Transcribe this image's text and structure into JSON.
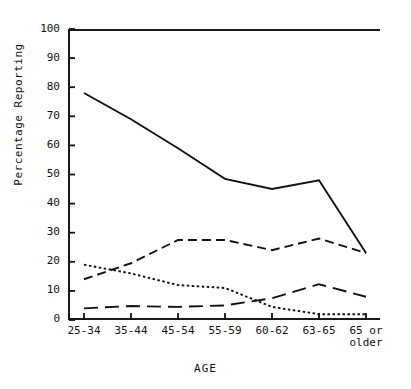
{
  "figure": {
    "background": "#ffffff",
    "ink": "#111111"
  },
  "chart_data": {
    "type": "line",
    "title": "",
    "subtitle": "",
    "xlabel": "AGE",
    "ylabel": "Percentage Reporting",
    "categories": [
      "25-34",
      "35-44",
      "45-54",
      "55-59",
      "60-62",
      "63-65",
      "65 or\nolder"
    ],
    "ylim": [
      0,
      100
    ],
    "ytick_step": 10,
    "yticks": [
      0,
      10,
      20,
      30,
      40,
      50,
      60,
      70,
      80,
      90,
      100
    ],
    "ytick_labels": [
      "0",
      "10",
      "20",
      "30",
      "40",
      "50",
      "60",
      "70",
      "80",
      "90",
      "100"
    ],
    "grid": false,
    "legend": "none",
    "frame": "left-top-bottom",
    "series": [
      {
        "name": "solid-series",
        "style": "solid",
        "dasharray": "",
        "width": 1.9,
        "color": "#111111",
        "values": [
          78,
          69,
          59,
          48.5,
          45,
          48,
          23
        ]
      },
      {
        "name": "medium-dash-series",
        "style": "dashed",
        "dasharray": "9,5",
        "width": 1.9,
        "color": "#111111",
        "values": [
          14,
          19.5,
          27.5,
          27.5,
          24,
          28,
          23
        ]
      },
      {
        "name": "dotted-series",
        "style": "dotted",
        "dasharray": "2.5,2.5",
        "width": 1.9,
        "color": "#111111",
        "values": [
          19,
          16,
          12,
          11,
          4.5,
          2,
          2
        ]
      },
      {
        "name": "long-dash-series",
        "style": "long-dashed",
        "dasharray": "14,7",
        "width": 1.9,
        "color": "#111111",
        "values": [
          4,
          4.8,
          4.5,
          5,
          7.5,
          12.3,
          8
        ]
      }
    ]
  }
}
